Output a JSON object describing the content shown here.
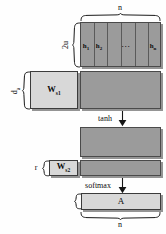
{
  "diagram": {
    "colors": {
      "matrix_fill": "#9b9b9b",
      "weight_fill": "#d8d8d8",
      "stroke": "#3b3b3b",
      "text": "#0b0b0b",
      "background": "#fefefe"
    },
    "labels": {
      "n_top": "n",
      "n_bottom": "n",
      "two_u": "2u",
      "d_a": "d",
      "d_a_sub": "a",
      "r": "r"
    },
    "hidden_states": {
      "items": [
        {
          "base": "h",
          "sub": "1"
        },
        {
          "base": "h",
          "sub": "2"
        }
      ],
      "ellipsis": "···",
      "last": {
        "base": "h",
        "sub": "n"
      }
    },
    "weights": [
      {
        "name": "w-s1",
        "base": "W",
        "sub": "s1"
      },
      {
        "name": "w-s2",
        "base": "W",
        "sub": "s2"
      }
    ],
    "activations": [
      {
        "name": "tanh",
        "label": "tanh"
      },
      {
        "name": "softmax",
        "label": "softmax"
      }
    ],
    "output": {
      "label": "A"
    }
  }
}
